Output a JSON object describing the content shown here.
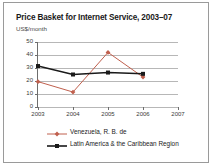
{
  "figure": {
    "title": "Price Basket for Internet Service, 2003–07",
    "subtitle": "US$/month",
    "frame_color": "#9a9a9a",
    "background": "#ffffff"
  },
  "chart_data": {
    "type": "line",
    "title": "Price Basket for Internet Service, 2003–07",
    "subtitle": "US$/month",
    "xlabel": "",
    "ylabel": "US$/month",
    "categories": [
      "2003",
      "2004",
      "2005",
      "2006",
      "2007"
    ],
    "x": [
      2003,
      2004,
      2005,
      2006,
      2007
    ],
    "xlim": [
      2003,
      2007
    ],
    "ylim": [
      0,
      50
    ],
    "yticks": [
      0,
      10,
      20,
      30,
      40,
      50
    ],
    "ytick_labels": [
      "0",
      "10",
      "20",
      "30",
      "40",
      "50"
    ],
    "xtick_labels": [
      "2003",
      "2004",
      "2005",
      "2006",
      "2007"
    ],
    "grid": true,
    "grid_axis": "y",
    "grid_color": "#b7b7b7",
    "legend_position": "bottom-left",
    "series": [
      {
        "name": "Venezuela, R. B. de",
        "color": "#c0604e",
        "marker": "diamond",
        "values": [
          19.5,
          11.5,
          42.0,
          23.0,
          null
        ]
      },
      {
        "name": "Latin America & the Caribbean Region",
        "color": "#1a1a1a",
        "marker": "square",
        "values": [
          31.5,
          25.0,
          26.5,
          25.5,
          null
        ]
      }
    ]
  },
  "legend": {
    "items": [
      {
        "label": "Venezuela, R. B. de",
        "color": "#c0604e",
        "marker": "diamond"
      },
      {
        "label": "Latin America & the Caribbean Region",
        "color": "#1a1a1a",
        "marker": "square"
      }
    ]
  }
}
